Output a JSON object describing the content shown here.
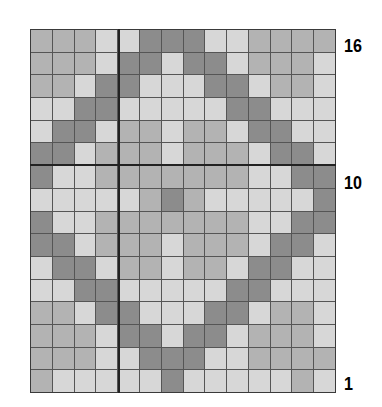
{
  "chart_data": {
    "type": "heatmap",
    "title": "",
    "columns": 14,
    "rows": 16,
    "row_order": "top-to-bottom from row 16 to row 1",
    "legend": {
      "D": "dark",
      "M": "medium",
      "L": "light"
    },
    "colors": {
      "D": "#8c8c8c",
      "M": "#b3b3b3",
      "L": "#d7d7d7",
      "grid": "#555555"
    },
    "grid": [
      [
        "M",
        "M",
        "M",
        "L",
        "L",
        "D",
        "D",
        "D",
        "L",
        "L",
        "M",
        "M",
        "M",
        "M"
      ],
      [
        "M",
        "M",
        "M",
        "L",
        "D",
        "D",
        "L",
        "D",
        "D",
        "L",
        "M",
        "M",
        "M",
        "L"
      ],
      [
        "M",
        "M",
        "L",
        "D",
        "D",
        "L",
        "L",
        "L",
        "D",
        "D",
        "L",
        "M",
        "M",
        "L"
      ],
      [
        "L",
        "L",
        "D",
        "D",
        "L",
        "L",
        "L",
        "L",
        "L",
        "D",
        "D",
        "L",
        "L",
        "L"
      ],
      [
        "L",
        "D",
        "D",
        "L",
        "M",
        "M",
        "L",
        "M",
        "M",
        "L",
        "D",
        "D",
        "L",
        "L"
      ],
      [
        "D",
        "D",
        "L",
        "M",
        "M",
        "M",
        "L",
        "M",
        "M",
        "M",
        "L",
        "D",
        "D",
        "L"
      ],
      [
        "D",
        "L",
        "L",
        "M",
        "M",
        "M",
        "M",
        "M",
        "M",
        "M",
        "L",
        "L",
        "D",
        "D"
      ],
      [
        "L",
        "L",
        "L",
        "L",
        "L",
        "M",
        "D",
        "M",
        "L",
        "L",
        "L",
        "L",
        "L",
        "D"
      ],
      [
        "D",
        "L",
        "L",
        "M",
        "M",
        "M",
        "M",
        "M",
        "M",
        "M",
        "L",
        "L",
        "D",
        "D"
      ],
      [
        "D",
        "D",
        "L",
        "M",
        "M",
        "M",
        "L",
        "M",
        "M",
        "M",
        "L",
        "D",
        "D",
        "L"
      ],
      [
        "L",
        "D",
        "D",
        "L",
        "M",
        "M",
        "L",
        "M",
        "M",
        "L",
        "D",
        "D",
        "L",
        "L"
      ],
      [
        "L",
        "L",
        "D",
        "D",
        "L",
        "L",
        "L",
        "L",
        "L",
        "D",
        "D",
        "L",
        "L",
        "L"
      ],
      [
        "M",
        "M",
        "L",
        "D",
        "D",
        "L",
        "L",
        "L",
        "D",
        "D",
        "L",
        "M",
        "M",
        "L"
      ],
      [
        "M",
        "M",
        "M",
        "L",
        "D",
        "D",
        "L",
        "D",
        "D",
        "L",
        "M",
        "M",
        "M",
        "L"
      ],
      [
        "M",
        "M",
        "M",
        "L",
        "L",
        "D",
        "D",
        "D",
        "L",
        "L",
        "M",
        "M",
        "M",
        "M"
      ],
      [
        "M",
        "L",
        "L",
        "L",
        "L",
        "L",
        "D",
        "L",
        "L",
        "L",
        "L",
        "L",
        "M",
        "L"
      ]
    ],
    "row_labels": [
      {
        "text": "16",
        "row": 16
      },
      {
        "text": "10",
        "row": 10
      },
      {
        "text": "1",
        "row": 1
      }
    ],
    "xlabel": "",
    "ylabel": ""
  },
  "labels": {
    "row16": "16",
    "row10": "10",
    "row1": "1"
  }
}
